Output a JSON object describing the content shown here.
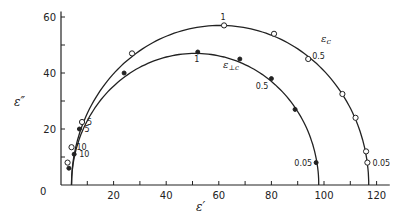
{
  "chart_data": {
    "type": "scatter",
    "title": "",
    "xlabel": "ε′",
    "ylabel": "ε″",
    "xlim": [
      0,
      125
    ],
    "ylim": [
      0,
      62
    ],
    "x_ticks": [
      0,
      20,
      40,
      60,
      80,
      100,
      120
    ],
    "x_minor_ticks": [
      10,
      30,
      50,
      70,
      90,
      110
    ],
    "y_ticks": [
      0,
      20,
      40,
      60
    ],
    "y_minor_ticks": [
      10,
      30,
      50
    ],
    "grid": false,
    "legend": "inline curve labels",
    "series": [
      {
        "name": "ε_c",
        "marker": "open-circle",
        "arc": {
          "eps_inf": 4,
          "eps_s": 117,
          "peak": 57
        },
        "points": [
          {
            "x": 2.5,
            "y": 8,
            "label": ""
          },
          {
            "x": 4,
            "y": 13.5,
            "label": "10"
          },
          {
            "x": 8,
            "y": 22.5,
            "label": "5"
          },
          {
            "x": 27,
            "y": 47,
            "label": ""
          },
          {
            "x": 62,
            "y": 57,
            "label": "1"
          },
          {
            "x": 81,
            "y": 54,
            "label": ""
          },
          {
            "x": 94,
            "y": 45,
            "label": "0.5"
          },
          {
            "x": 107,
            "y": 32.5,
            "label": ""
          },
          {
            "x": 112,
            "y": 24,
            "label": ""
          },
          {
            "x": 116,
            "y": 12,
            "label": ""
          },
          {
            "x": 116.5,
            "y": 8,
            "label": "0.05"
          }
        ]
      },
      {
        "name": "ε⊥c",
        "marker": "filled-circle",
        "arc": {
          "eps_inf": 4,
          "eps_s": 98,
          "peak": 47
        },
        "points": [
          {
            "x": 3,
            "y": 6,
            "label": ""
          },
          {
            "x": 5,
            "y": 11,
            "label": "10"
          },
          {
            "x": 7,
            "y": 20,
            "label": "5"
          },
          {
            "x": 24,
            "y": 40,
            "label": ""
          },
          {
            "x": 52,
            "y": 47.5,
            "label": "1"
          },
          {
            "x": 68,
            "y": 45,
            "label": ""
          },
          {
            "x": 80,
            "y": 38,
            "label": "0.5"
          },
          {
            "x": 89,
            "y": 27,
            "label": ""
          },
          {
            "x": 97,
            "y": 8,
            "label": "0.05"
          }
        ]
      }
    ],
    "annotations": [
      "ε_c",
      "ε⊥c"
    ]
  },
  "labels": {
    "xlabel": "ε′",
    "ylabel": "ε″",
    "origin": "0",
    "series_c": "ε",
    "series_c_sub": "c",
    "series_perp": "ε",
    "series_perp_sub": "⊥c"
  }
}
